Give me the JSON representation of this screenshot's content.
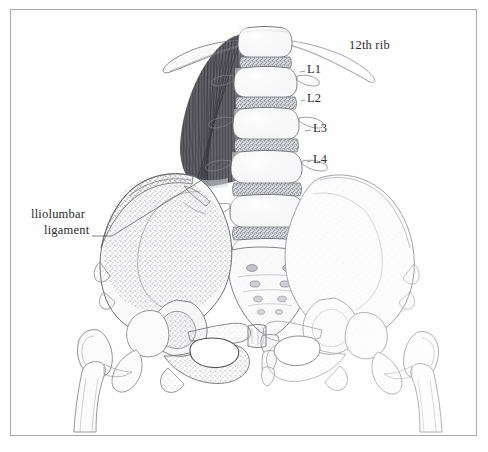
{
  "figure": {
    "kind": "anatomical-illustration",
    "medium": "pencil and stipple drawing",
    "background_color": "#fefefe",
    "frame_color": "#a9a9ac",
    "ink_color": "#2b2b2f",
    "bone_outline_color": "#6f7076",
    "stipple_color": "#8b8c92",
    "muscle_color": "#4a4a50"
  },
  "labels": {
    "rib": "12th rib",
    "level_1": "L1",
    "level_2": "L2",
    "level_3": "L3",
    "level_4": "L4",
    "ligament_line_1": "lliolumbar",
    "ligament_line_2": "ligament"
  },
  "structures": [
    "T12 vertebra",
    "12th rib (left, shaded)",
    "12th rib (right, outlined)",
    "L1 vertebral body",
    "L2 vertebral body",
    "L3 vertebral body",
    "L4 vertebral body",
    "L5 vertebral body",
    "intervertebral discs (stippled)",
    "transverse processes",
    "quadratus lumborum muscle",
    "iliolumbar ligament",
    "left ilium (heavily stippled)",
    "right ilium (lightly stippled)",
    "sacrum with sacral foramina",
    "coccyx",
    "pubic symphysis",
    "obturator foramen (left)",
    "obturator foramen (right)",
    "left femur: head, neck, greater trochanter, shaft",
    "right femur: head, neck, greater trochanter, shaft"
  ],
  "leader_lines": [
    {
      "name": "iliolumbar-ligament-leader",
      "from": [
        107,
        236
      ],
      "to": [
        205,
        178
      ]
    }
  ]
}
